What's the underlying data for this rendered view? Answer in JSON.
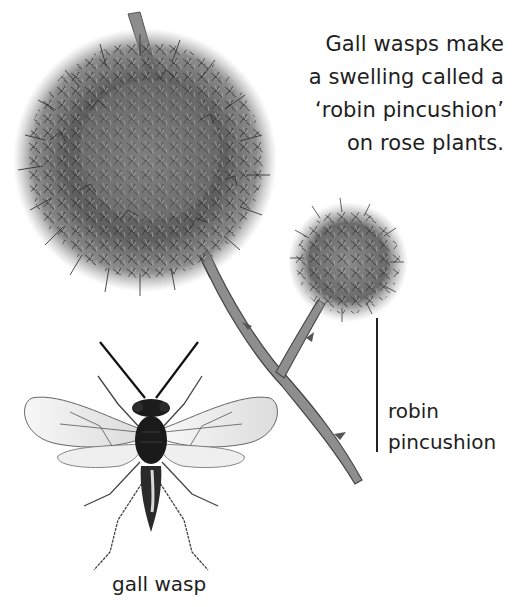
{
  "caption": {
    "lines": [
      "Gall wasps make",
      "a swelling called a",
      "‘robin pincushion’",
      "on rose plants."
    ]
  },
  "labels": {
    "robin_pincushion": [
      "robin",
      "pincushion"
    ],
    "gall_wasp": "gall wasp"
  },
  "illustration": {
    "subjects": [
      "large robin pincushion gall",
      "small robin pincushion gall",
      "rose stem with thorns",
      "gall wasp (dorsal view)"
    ],
    "colors": {
      "gall_dark": "#3d3d3d",
      "gall_mid": "#6b6b6b",
      "gall_light": "#9a9a9a",
      "stem": "#7a7a7a",
      "wasp_body": "#1c1c1c",
      "wing_fill": "#ededed",
      "background": "#ffffff"
    }
  }
}
